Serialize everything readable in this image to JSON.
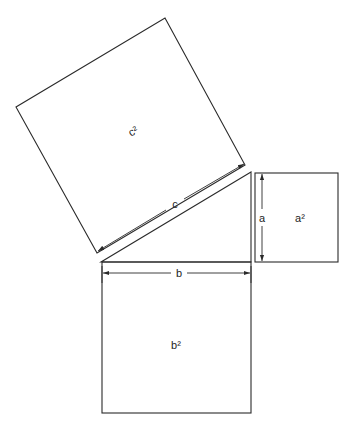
{
  "labels": {
    "square_c": "c²",
    "square_a": "a²",
    "square_b": "b²",
    "side_c": "c",
    "side_a": "a",
    "side_b": "b"
  },
  "colors": {
    "stroke": "#2a2a2a",
    "background": "#ffffff"
  },
  "geometry": {
    "triangle": [
      [
        101,
        262
      ],
      [
        251,
        262
      ],
      [
        251,
        172
      ]
    ],
    "square_c": [
      [
        165,
        18
      ],
      [
        245,
        165
      ],
      [
        97,
        253
      ],
      [
        16,
        107
      ]
    ],
    "square_a": {
      "x": 255,
      "y": 173,
      "w": 83,
      "h": 89
    },
    "square_b": {
      "x": 102,
      "y": 262,
      "w": 149,
      "h": 151
    }
  }
}
